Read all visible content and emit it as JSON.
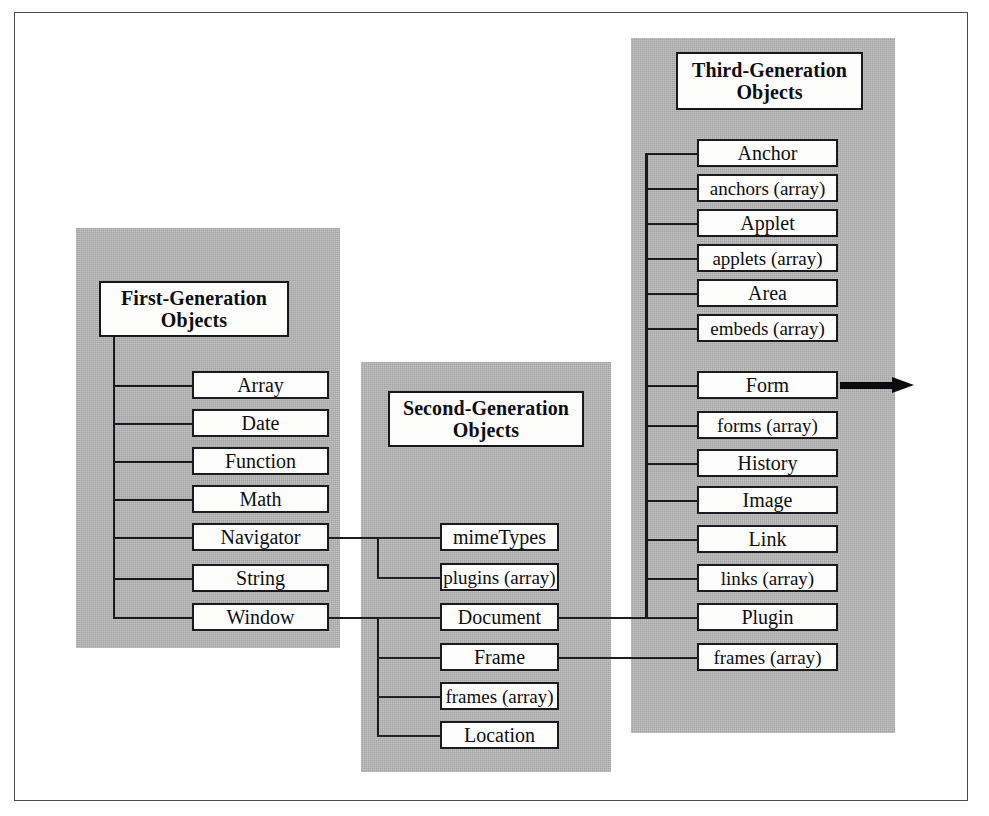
{
  "figure": {
    "kind": "hierarchy-diagram",
    "background_color": "#ffffff",
    "panel_color": "#b3b3b3",
    "line_color": "#19191f",
    "box_fill": "#fdfdfb",
    "frame_color": "#4a4a52"
  },
  "generations": [
    {
      "id": "first",
      "title_line1": "First-Generation",
      "title_line2": "Objects",
      "nodes": [
        {
          "label": "Array"
        },
        {
          "label": "Date"
        },
        {
          "label": "Function"
        },
        {
          "label": "Math"
        },
        {
          "label": "Navigator"
        },
        {
          "label": "String"
        },
        {
          "label": "Window"
        }
      ]
    },
    {
      "id": "second",
      "title_line1": "Second-Generation",
      "title_line2": "Objects",
      "nodes": [
        {
          "label": "mimeTypes"
        },
        {
          "label": "plugins (array)"
        },
        {
          "label": "Document"
        },
        {
          "label": "Frame"
        },
        {
          "label": "frames (array)"
        },
        {
          "label": "Location"
        }
      ]
    },
    {
      "id": "third",
      "title_line1": "Third-Generation",
      "title_line2": "Objects",
      "nodes": [
        {
          "label": "Anchor"
        },
        {
          "label": "anchors (array)"
        },
        {
          "label": "Applet"
        },
        {
          "label": "applets (array)"
        },
        {
          "label": "Area"
        },
        {
          "label": "embeds (array)"
        },
        {
          "label": "Form"
        },
        {
          "label": "forms (array)"
        },
        {
          "label": "History"
        },
        {
          "label": "Image"
        },
        {
          "label": "Link"
        },
        {
          "label": "links (array)"
        },
        {
          "label": "Plugin"
        },
        {
          "label": "frames (array)"
        }
      ]
    }
  ],
  "cross_links": [
    {
      "from": "Navigator",
      "to": "mimeTypes / plugins (array)"
    },
    {
      "from": "Window",
      "to": "Document / Frame / frames (array) / Location"
    },
    {
      "from": "Document",
      "to": "third-generation objects"
    },
    {
      "from": "Frame",
      "to": "frames (array)"
    }
  ],
  "annotations": [
    {
      "name": "form-continuation-arrow",
      "from": "Form",
      "direction": "right"
    }
  ]
}
